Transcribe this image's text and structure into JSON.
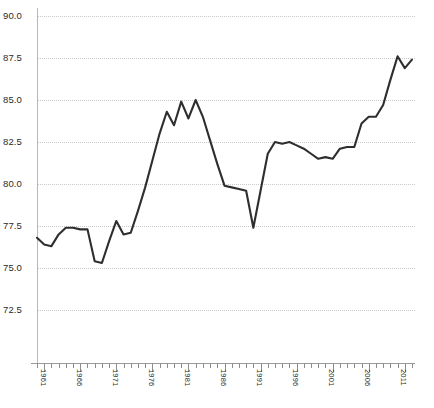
{
  "chart_data": {
    "type": "line",
    "title": "",
    "subtitle": "",
    "xlabel": "",
    "ylabel": "",
    "xlim": [
      1960,
      2012
    ],
    "ylim": [
      71.5,
      90.8
    ],
    "grid": true,
    "legend": false,
    "legend_position": "none",
    "line_color": "#2e2e2e",
    "grid_color": "#c9c9c9",
    "axis_color": "#9a9a9a",
    "y_ticks": [
      90.0,
      87.5,
      85.0,
      82.5,
      80.0,
      77.5,
      75.0,
      72.5
    ],
    "y_tick_labels": [
      "90.0",
      "87.5",
      "85.0",
      "82.5",
      "80.0",
      "77.5",
      "75.0",
      "72.5"
    ],
    "x_ticks": [
      1961,
      1966,
      1971,
      1976,
      1981,
      1986,
      1991,
      1996,
      2001,
      2006,
      2011
    ],
    "x_tick_labels": [
      "1961",
      "1966",
      "1971",
      "1976",
      "1981",
      "1986",
      "1991",
      "1996",
      "2001",
      "2006",
      "2011"
    ],
    "x_minor_tick_interval": 1,
    "x": [
      1960,
      1961,
      1962,
      1963,
      1964,
      1965,
      1966,
      1967,
      1968,
      1969,
      1970,
      1971,
      1972,
      1973,
      1974,
      1975,
      1976,
      1977,
      1978,
      1979,
      1980,
      1981,
      1982,
      1983,
      1984,
      1985,
      1986,
      1987,
      1988,
      1989,
      1990,
      1991,
      1992,
      1993,
      1994,
      1995,
      1996,
      1997,
      1998,
      1999,
      2000,
      2001,
      2002,
      2003,
      2004,
      2005,
      2006,
      2007,
      2008,
      2009,
      2010,
      2011,
      2012
    ],
    "values": [
      76.8,
      76.4,
      76.3,
      77.0,
      77.4,
      77.4,
      77.3,
      77.3,
      75.4,
      75.3,
      76.6,
      77.8,
      77.0,
      77.1,
      78.4,
      79.8,
      81.4,
      83.0,
      84.3,
      83.5,
      84.9,
      83.9,
      85.0,
      84.0,
      82.6,
      81.2,
      79.9,
      79.8,
      79.7,
      79.6,
      77.4,
      79.6,
      81.8,
      82.5,
      82.4,
      82.5,
      82.3,
      82.1,
      81.8,
      81.5,
      81.6,
      81.5,
      82.1,
      82.2,
      82.2,
      83.6,
      84.0,
      84.0,
      84.7,
      86.2,
      87.6,
      86.9,
      87.4
    ],
    "series_name": "value"
  }
}
